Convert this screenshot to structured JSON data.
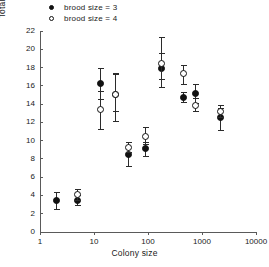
{
  "chart_data": {
    "type": "scatter",
    "title": "",
    "xlabel": "Colony size",
    "ylabel": "Total food deliveries to brood by both parents",
    "xscale": "log",
    "xlim": [
      1,
      10000
    ],
    "ylim": [
      0,
      22
    ],
    "xticks": [
      "1",
      "10",
      "100",
      "1000",
      "10000"
    ],
    "xtick_values": [
      1,
      10,
      100,
      1000,
      10000
    ],
    "yticks": [
      "0",
      "2",
      "4",
      "6",
      "8",
      "10",
      "12",
      "14",
      "16",
      "18",
      "20",
      "22"
    ],
    "ytick_values": [
      0,
      2,
      4,
      6,
      8,
      10,
      12,
      14,
      16,
      18,
      20,
      22
    ],
    "grid": false,
    "legend_position": "top-left",
    "legend": [
      {
        "label": "brood size = 3",
        "marker": "filled-circle"
      },
      {
        "label": "brood size = 4",
        "marker": "open-circle"
      }
    ],
    "series": [
      {
        "name": "brood size = 3",
        "marker": "filled-circle",
        "points": [
          {
            "x": 2,
            "y": 3.4,
            "ylow": 2.5,
            "yhigh": 4.4
          },
          {
            "x": 5,
            "y": 3.5,
            "ylow": 2.9,
            "yhigh": 4.1
          },
          {
            "x": 13,
            "y": 16.2,
            "ylow": 14.6,
            "yhigh": 17.9
          },
          {
            "x": 25,
            "y": 15.0,
            "ylow": 13.2,
            "yhigh": 17.3
          },
          {
            "x": 43,
            "y": 8.5,
            "ylow": 7.2,
            "yhigh": 9.8
          },
          {
            "x": 88,
            "y": 9.1,
            "ylow": 8.3,
            "yhigh": 9.9
          },
          {
            "x": 180,
            "y": 17.9,
            "ylow": 15.9,
            "yhigh": 19.6
          },
          {
            "x": 460,
            "y": 14.7,
            "ylow": 14.2,
            "yhigh": 15.3
          },
          {
            "x": 750,
            "y": 15.2,
            "ylow": 14.1,
            "yhigh": 16.2
          },
          {
            "x": 2200,
            "y": 12.5,
            "ylow": 11.2,
            "yhigh": 13.6
          }
        ]
      },
      {
        "name": "brood size = 4",
        "marker": "open-circle",
        "points": [
          {
            "x": 5,
            "y": 4.1,
            "ylow": 3.5,
            "yhigh": 4.7
          },
          {
            "x": 13,
            "y": 13.4,
            "ylow": 11.3,
            "yhigh": 15.4
          },
          {
            "x": 25,
            "y": 15.1,
            "ylow": 12.2,
            "yhigh": 17.4
          },
          {
            "x": 43,
            "y": 9.3,
            "ylow": 8.8,
            "yhigh": 9.9
          },
          {
            "x": 88,
            "y": 10.5,
            "ylow": 9.6,
            "yhigh": 11.5
          },
          {
            "x": 180,
            "y": 18.4,
            "ylow": 16.8,
            "yhigh": 21.3
          },
          {
            "x": 460,
            "y": 17.3,
            "ylow": 16.2,
            "yhigh": 18.3
          },
          {
            "x": 750,
            "y": 13.9,
            "ylow": 13.2,
            "yhigh": 14.7
          },
          {
            "x": 2200,
            "y": 13.2,
            "ylow": 12.6,
            "yhigh": 13.9
          }
        ]
      }
    ]
  }
}
